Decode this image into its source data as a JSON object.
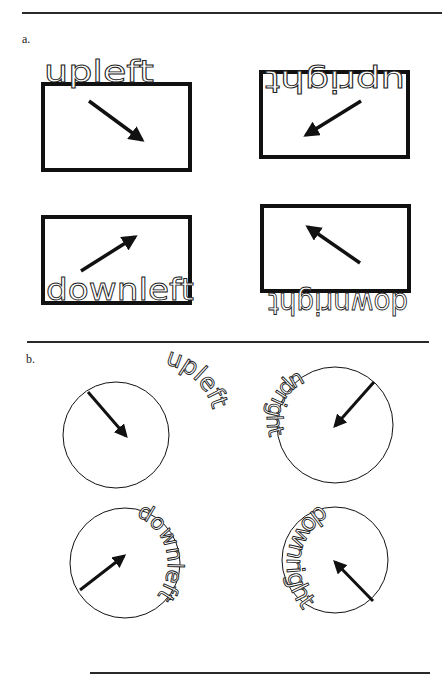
{
  "figure": {
    "panels": [
      {
        "label": "a.",
        "shape": "rectangle",
        "items": [
          {
            "word": "upleft",
            "arrow": "down-right",
            "text_position": "top, upright, above box"
          },
          {
            "word": "upright",
            "arrow": "down-left",
            "text_position": "top, upside-down, inside box"
          },
          {
            "word": "downleft",
            "arrow": "up-right",
            "text_position": "bottom, upright, inside box"
          },
          {
            "word": "downright",
            "arrow": "up-left",
            "text_position": "bottom, upside-down, below box"
          }
        ]
      },
      {
        "label": "b.",
        "shape": "circle",
        "items": [
          {
            "word": "upleft",
            "arrow": "down-right",
            "text_position": "outside circle, upper right"
          },
          {
            "word": "upright",
            "arrow": "down-left",
            "text_position": "inside circle, left"
          },
          {
            "word": "downleft",
            "arrow": "up-right",
            "text_position": "inside circle, right"
          },
          {
            "word": "downright",
            "arrow": "up-left",
            "text_position": "outside circle, left"
          }
        ]
      }
    ],
    "colors": {
      "stroke": "#111111",
      "background": "#ffffff",
      "rule": "#2a2a2a"
    }
  }
}
